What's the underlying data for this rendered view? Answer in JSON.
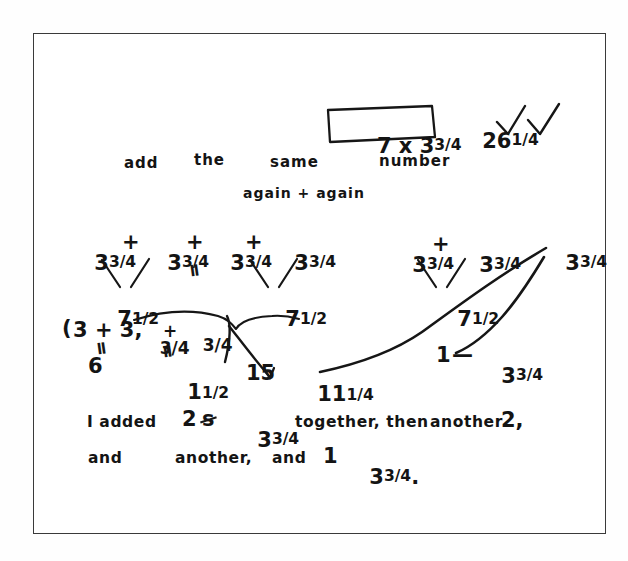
{
  "document": {
    "kind": "handwritten-math-worksheet",
    "frame_color": "#3a3a3a",
    "ink_color": "#161616",
    "paper_color": "#ffffff"
  },
  "boxed": {
    "expression": "7 x 3",
    "expression_fraction": "3/4",
    "answer_whole": "26",
    "answer_fraction": "1/4",
    "check_marks": 2
  },
  "prompt_line": {
    "word1": "add",
    "word2": "the",
    "word3": "same",
    "word4": "number",
    "word5": "again + again"
  },
  "left_work": {
    "row1": {
      "term1_whole": "3",
      "term1_frac": "3/4",
      "plus1": "+",
      "term2_whole": "3",
      "term2_frac": "3/4",
      "plus2": "+",
      "term3_whole": "3",
      "term3_frac": "3/4",
      "plus3": "+",
      "term4_whole": "3",
      "term4_frac": "3/4"
    },
    "equals_mark": "ll",
    "partial1_whole": "7",
    "partial1_frac": "1/2",
    "partial2_whole": "7",
    "partial2_frac": "1/2",
    "breakdown": {
      "open_paren": "(",
      "whole_sum": "3 + 3,",
      "frac_sum_a": "3/4",
      "frac_plus": "+",
      "frac_sum_b": "3/4",
      "eq_left": "ll",
      "result_left": "6",
      "eq_right": "ll",
      "result_right_whole": "1",
      "result_right_frac": "1/2"
    },
    "total": "15",
    "grand_total_whole": "11",
    "grand_total_frac": "1/4"
  },
  "right_work": {
    "row1": {
      "term1_whole": "3",
      "term1_frac": "3/4",
      "plus1": "+",
      "term2_whole": "3",
      "term2_frac": "3/4"
    },
    "standalone_whole": "3",
    "standalone_frac": "3/4",
    "partial_whole": "7",
    "partial_frac": "1/2",
    "remainder_count": "1",
    "remainder_dash": "—",
    "remainder_whole": "3",
    "remainder_frac": "3/4"
  },
  "explanation": {
    "line1_a": "I added",
    "line1_count": "2",
    "line1_struck": "s",
    "line1_value_whole": "3",
    "line1_value_frac": "3/4",
    "line1_b": "together, then",
    "line1_c": "another",
    "line1_d": "2,",
    "line2_a": "and",
    "line2_b": "another,",
    "line2_c": "and",
    "line2_d": "1",
    "line2_value_whole": "3",
    "line2_value_frac": "3/4",
    "line2_period": "."
  }
}
